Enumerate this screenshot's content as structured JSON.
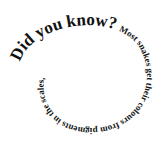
{
  "spiral": {
    "heading": "Did you know?",
    "body": "Most snakes get their colours from pigments in the scales,"
  },
  "colors": {
    "text": "#111111",
    "background": "#ffffff"
  }
}
